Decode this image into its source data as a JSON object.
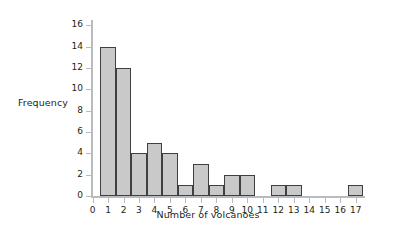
{
  "chart_data": {
    "type": "bar",
    "title": "",
    "xlabel": "Number of volcanoes",
    "ylabel": "Frequency",
    "categories": [
      "1",
      "2",
      "3",
      "4",
      "5",
      "6",
      "7",
      "8",
      "9",
      "10",
      "11",
      "12",
      "13",
      "14",
      "15",
      "16",
      "17"
    ],
    "values": [
      14,
      12,
      4,
      5,
      4,
      1,
      3,
      1,
      2,
      2,
      0,
      1,
      1,
      0,
      0,
      0,
      1
    ],
    "x_tick_labels": [
      "0",
      "1",
      "2",
      "3",
      "4",
      "5",
      "6",
      "7",
      "8",
      "9",
      "10",
      "11",
      "12",
      "13",
      "14",
      "15",
      "16",
      "17"
    ],
    "y_tick_labels": [
      "0",
      "2",
      "4",
      "6",
      "8",
      "10",
      "12",
      "14",
      "16"
    ],
    "y_tick_values": [
      0,
      2,
      4,
      6,
      8,
      10,
      12,
      14,
      16
    ],
    "xlim": [
      -0.1,
      17.6
    ],
    "ylim": [
      0,
      16.5
    ],
    "grid": false,
    "legend": null,
    "bar_fill_color": "#c9c9c9",
    "bar_edge_color": "#3f3f3f",
    "axis_color": "#b9bcbe",
    "text_color": "#231f20",
    "background_color": "#ffffff"
  }
}
